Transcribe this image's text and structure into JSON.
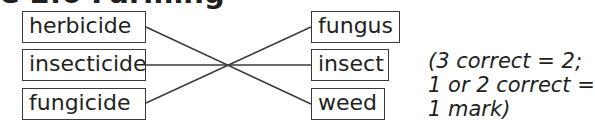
{
  "heading": {
    "text": "e 2.6 Farming"
  },
  "matching": {
    "left_items": [
      {
        "label": "herbicide"
      },
      {
        "label": "insecticide"
      },
      {
        "label": "fungicide"
      }
    ],
    "right_items": [
      {
        "label": "fungus"
      },
      {
        "label": "insect"
      },
      {
        "label": "weed"
      }
    ],
    "connections": [
      {
        "from": "herbicide",
        "to": "weed"
      },
      {
        "from": "insecticide",
        "to": "insect"
      },
      {
        "from": "fungicide",
        "to": "fungus"
      }
    ],
    "line_color": "#3a3a3a"
  },
  "mark_scheme": {
    "lines": [
      "(3 correct = 2;",
      "1 or 2 correct =",
      "1 mark)"
    ]
  }
}
